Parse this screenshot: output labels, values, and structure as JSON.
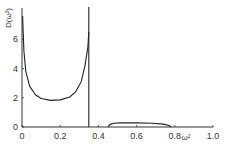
{
  "chart_data": {
    "type": "line",
    "title": "",
    "xlabel": "ω²",
    "ylabel": "D(ω²)",
    "xlim": [
      0,
      1.0
    ],
    "ylim": [
      0,
      8
    ],
    "grid": false,
    "legend": null,
    "x_ticks": [
      "0",
      "0.2",
      "0.4",
      "0.6",
      "0.8",
      "1.0"
    ],
    "x_tick_values": [
      0,
      0.2,
      0.4,
      0.6,
      0.8,
      1.0
    ],
    "y_ticks": [
      "0",
      "2",
      "4",
      "6"
    ],
    "y_tick_values": [
      0,
      2,
      4,
      6
    ],
    "series": [
      {
        "name": "acoustic band",
        "x": [
          0.003,
          0.01,
          0.02,
          0.04,
          0.07,
          0.1,
          0.15,
          0.2,
          0.25,
          0.28,
          0.31,
          0.33,
          0.345,
          0.35
        ],
        "y": [
          7.6,
          5.2,
          3.8,
          2.8,
          2.2,
          1.95,
          1.82,
          1.85,
          2.05,
          2.4,
          3.1,
          4.2,
          5.5,
          6.5
        ]
      },
      {
        "name": "band edge singularity",
        "x": [
          0.35,
          0.35
        ],
        "y": [
          0,
          8.2
        ]
      },
      {
        "name": "optical band",
        "x": [
          0.45,
          0.46,
          0.48,
          0.52,
          0.6,
          0.68,
          0.74,
          0.77,
          0.78
        ],
        "y": [
          0.0,
          0.18,
          0.25,
          0.28,
          0.28,
          0.26,
          0.2,
          0.1,
          0.0
        ]
      }
    ]
  },
  "labels": {
    "ylabel": "D(ω²)",
    "xlabel": "ω²"
  }
}
